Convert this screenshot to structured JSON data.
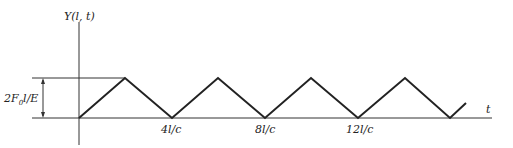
{
  "figure": {
    "y_axis_label": "Y(l, t)",
    "x_axis_label": "t",
    "amplitude_label": "2F",
    "amplitude_sub": "0",
    "amplitude_rest": "l/E",
    "ticks": [
      "4l/c",
      "8l/c",
      "12l/c"
    ],
    "waveform": "triangular",
    "line_color": "#222222"
  }
}
